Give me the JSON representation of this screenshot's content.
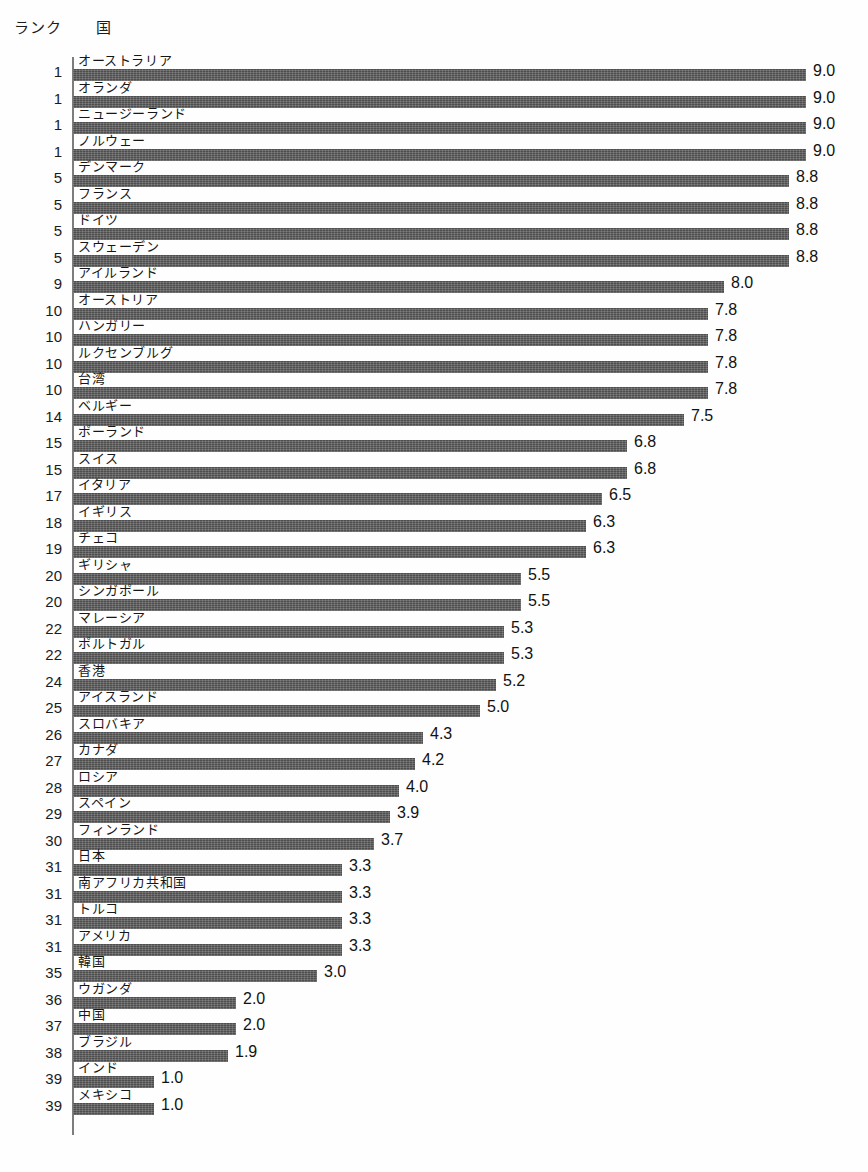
{
  "header": {
    "rank_label": "ランク",
    "country_label": "国"
  },
  "style": {
    "bar_color": "#4e4e4e",
    "axis_color": "#7d7d7d",
    "background": "#fefefe",
    "text_color": "#1b1b1b"
  },
  "chart_data": {
    "type": "bar",
    "orientation": "horizontal",
    "title": "",
    "xlabel": "",
    "ylabel": "",
    "xlim": [
      0,
      9.0
    ],
    "grid": false,
    "legend": "none",
    "value_labels": true,
    "columns": [
      "ランク",
      "国",
      "値"
    ],
    "categories": [
      "オーストラリア",
      "オランダ",
      "ニュージーランド",
      "ノルウェー",
      "デンマーク",
      "フランス",
      "ドイツ",
      "スウェーデン",
      "アイルランド",
      "オーストリア",
      "ハンガリー",
      "ルクセンブルグ",
      "台湾",
      "ベルギー",
      "ポーランド",
      "スイス",
      "イタリア",
      "イギリス",
      "チェコ",
      "ギリシャ",
      "シンガポール",
      "マレーシア",
      "ポルトガル",
      "香港",
      "アイスランド",
      "スロバキア",
      "カナダ",
      "ロシア",
      "スペイン",
      "フィンランド",
      "日本",
      "南アフリカ共和国",
      "トルコ",
      "アメリカ",
      "韓国",
      "ウガンダ",
      "中国",
      "ブラジル",
      "インド",
      "メキシコ"
    ],
    "values": [
      9.0,
      9.0,
      9.0,
      9.0,
      8.8,
      8.8,
      8.8,
      8.8,
      8.0,
      7.8,
      7.8,
      7.8,
      7.8,
      7.5,
      6.8,
      6.8,
      6.5,
      6.3,
      6.3,
      5.5,
      5.5,
      5.3,
      5.3,
      5.2,
      5.0,
      4.3,
      4.2,
      4.0,
      3.9,
      3.7,
      3.3,
      3.3,
      3.3,
      3.3,
      3.0,
      2.0,
      2.0,
      1.9,
      1.0,
      1.0
    ],
    "ranks": [
      "1",
      "1",
      "1",
      "1",
      "5",
      "5",
      "5",
      "5",
      "9",
      "10",
      "10",
      "10",
      "10",
      "14",
      "15",
      "15",
      "17",
      "18",
      "19",
      "20",
      "20",
      "22",
      "22",
      "24",
      "25",
      "26",
      "27",
      "28",
      "29",
      "30",
      "31",
      "31",
      "31",
      "31",
      "35",
      "36",
      "37",
      "38",
      "39",
      "39"
    ],
    "value_labels_text": [
      "9.0",
      "9.0",
      "9.0",
      "9.0",
      "8.8",
      "8.8",
      "8.8",
      "8.8",
      "8.0",
      "7.8",
      "7.8",
      "7.8",
      "7.8",
      "7.5",
      "6.8",
      "6.8",
      "6.5",
      "6.3",
      "6.3",
      "5.5",
      "5.5",
      "5.3",
      "5.3",
      "5.2",
      "5.0",
      "4.3",
      "4.2",
      "4.0",
      "3.9",
      "3.7",
      "3.3",
      "3.3",
      "3.3",
      "3.3",
      "3.0",
      "2.0",
      "2.0",
      "1.9",
      "1.0",
      "1.0"
    ]
  }
}
